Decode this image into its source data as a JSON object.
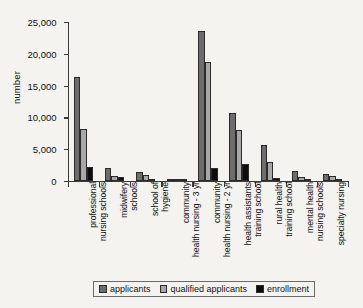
{
  "chart_data": {
    "type": "bar",
    "title": "",
    "xlabel": "",
    "ylabel": "number",
    "ylim": [
      0,
      25000
    ],
    "yticks": [
      0,
      5000,
      10000,
      15000,
      20000,
      25000
    ],
    "ytick_labels": [
      "0",
      "5,000",
      "10,000",
      "15,000",
      "20,000",
      "25,000"
    ],
    "grid": false,
    "legend_position": "bottom",
    "categories": [
      "professional\nnursing schools",
      "midwifery\nschools",
      "school of\nhygiene",
      "community\nhealth nursing - 3 yr",
      "community\nhealth nursing - 2 yr",
      "health assistants\ntraining school",
      "rural health\ntraining school",
      "mental health\nnursing schools",
      "specialty nursing"
    ],
    "series": [
      {
        "name": "applicants",
        "color": "#6d6d6d",
        "values": [
          16400,
          2000,
          1350,
          200,
          23600,
          10700,
          5600,
          1500,
          1100
        ]
      },
      {
        "name": "qualified applicants",
        "color": "#a8a8a8",
        "values": [
          8100,
          750,
          900,
          150,
          18700,
          8000,
          3000,
          700,
          800
        ]
      },
      {
        "name": "enrollment",
        "color": "#0d0d0d",
        "values": [
          2200,
          600,
          350,
          50,
          2100,
          2700,
          500,
          150,
          200
        ]
      }
    ]
  }
}
